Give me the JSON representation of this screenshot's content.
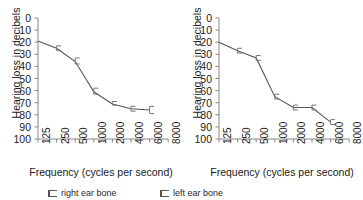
{
  "figure": {
    "ylabel": "Hearing loss in decibels",
    "xlabel": "Frequency (cycles per second)",
    "ytick_labels": [
      "0",
      "10",
      "20",
      "30",
      "40",
      "50",
      "60",
      "70",
      "80",
      "90",
      "100"
    ],
    "xtick_labels": [
      "125",
      "250",
      "500",
      "1000",
      "2000",
      "4000",
      "6000",
      "8000"
    ],
    "line_color": "#555555",
    "marker_color": "#777777",
    "axis_color": "#888888"
  },
  "legend": {
    "entries": [
      {
        "symbol": "error-bar-symbol",
        "label": "right ear bone"
      },
      {
        "symbol": "error-bar-symbol",
        "label": "left ear bone"
      }
    ]
  },
  "chart_data": [
    {
      "type": "line",
      "title": "",
      "subtitle": "",
      "panel": "left",
      "series_name": "right ear bone",
      "xlabel": "Frequency (cycles per second)",
      "ylabel": "Hearing loss in decibels",
      "x": [
        125,
        250,
        500,
        1000,
        2000,
        4000,
        6000
      ],
      "xtick_labels": [
        "125",
        "250",
        "500",
        "1000",
        "2000",
        "4000",
        "6000",
        "8000"
      ],
      "values": [
        19,
        25,
        36,
        61,
        71,
        75,
        76
      ],
      "error_low": [
        19,
        23,
        33,
        58,
        69,
        73,
        73
      ],
      "error_high": [
        19,
        27,
        38,
        63,
        72,
        77,
        79
      ],
      "ylim": [
        0,
        100
      ],
      "yticks": [
        0,
        10,
        20,
        30,
        40,
        50,
        60,
        70,
        80,
        90,
        100
      ],
      "y_inverted": true,
      "x_scale": "log2-categorical",
      "grid": false,
      "legend_position": "below-figure",
      "annotations": []
    },
    {
      "type": "line",
      "title": "",
      "subtitle": "",
      "panel": "right",
      "series_name": "left ear bone",
      "xlabel": "Frequency (cycles per second)",
      "ylabel": "Hearing loss in decibels",
      "x": [
        125,
        250,
        500,
        1000,
        2000,
        4000,
        6000
      ],
      "xtick_labels": [
        "125",
        "250",
        "500",
        "1000",
        "2000",
        "4000",
        "6000",
        "8000"
      ],
      "values": [
        20,
        27,
        33,
        65,
        74,
        74,
        86
      ],
      "error_low": [
        20,
        25,
        31,
        63,
        72,
        72,
        84
      ],
      "error_high": [
        20,
        29,
        35,
        67,
        76,
        76,
        88
      ],
      "ylim": [
        0,
        100
      ],
      "yticks": [
        0,
        10,
        20,
        30,
        40,
        50,
        60,
        70,
        80,
        90,
        100
      ],
      "y_inverted": true,
      "x_scale": "log2-categorical",
      "grid": false,
      "legend_position": "below-figure",
      "annotations": []
    }
  ]
}
